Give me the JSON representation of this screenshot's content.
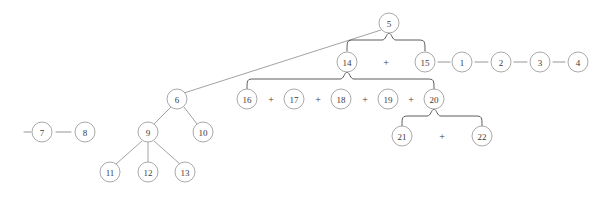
{
  "diagram": {
    "type": "tree",
    "canvas": {
      "width": 615,
      "height": 202
    },
    "colors": {
      "background": "#ffffff",
      "node_stroke": "#9a9a9a",
      "node_fill": "#ffffff",
      "node_text": "#3a3a3a",
      "edge": "#8a8a8a",
      "brace": "#4a4a4a"
    },
    "node_radius": 10,
    "nodes": [
      {
        "id": "n5",
        "label": "5",
        "cx": 389,
        "cy": 23,
        "r": 10
      },
      {
        "id": "n14",
        "label": "14",
        "cx": 347,
        "cy": 62,
        "r": 10
      },
      {
        "id": "n15",
        "label": "15",
        "cx": 425,
        "cy": 62,
        "r": 10
      },
      {
        "id": "n1",
        "label": "1",
        "cx": 462,
        "cy": 62,
        "r": 10
      },
      {
        "id": "n2",
        "label": "2",
        "cx": 501,
        "cy": 62,
        "r": 10
      },
      {
        "id": "n3",
        "label": "3",
        "cx": 540,
        "cy": 62,
        "r": 10
      },
      {
        "id": "n4",
        "label": "4",
        "cx": 578,
        "cy": 62,
        "r": 10
      },
      {
        "id": "n6",
        "label": "6",
        "cx": 177,
        "cy": 99,
        "r": 10
      },
      {
        "id": "n16",
        "label": "16",
        "cx": 247,
        "cy": 99,
        "r": 10
      },
      {
        "id": "n17",
        "label": "17",
        "cx": 294,
        "cy": 99,
        "r": 10
      },
      {
        "id": "n18",
        "label": "18",
        "cx": 341,
        "cy": 99,
        "r": 10
      },
      {
        "id": "n19",
        "label": "19",
        "cx": 388,
        "cy": 99,
        "r": 10
      },
      {
        "id": "n20",
        "label": "20",
        "cx": 434,
        "cy": 99,
        "r": 10
      },
      {
        "id": "n7",
        "label": "7",
        "cx": 42,
        "cy": 132,
        "r": 10
      },
      {
        "id": "n8",
        "label": "8",
        "cx": 85,
        "cy": 132,
        "r": 10
      },
      {
        "id": "n9",
        "label": "9",
        "cx": 148,
        "cy": 132,
        "r": 10
      },
      {
        "id": "n10",
        "label": "10",
        "cx": 203,
        "cy": 132,
        "r": 10
      },
      {
        "id": "n21",
        "label": "21",
        "cx": 402,
        "cy": 136,
        "r": 10
      },
      {
        "id": "n22",
        "label": "22",
        "cx": 482,
        "cy": 136,
        "r": 10
      },
      {
        "id": "n11",
        "label": "11",
        "cx": 110,
        "cy": 172,
        "r": 10
      },
      {
        "id": "n12",
        "label": "12",
        "cx": 148,
        "cy": 172,
        "r": 10
      },
      {
        "id": "n13",
        "label": "13",
        "cx": 185,
        "cy": 172,
        "r": 10
      }
    ],
    "operators": [
      {
        "id": "op-14-15",
        "label": "+",
        "x": 386,
        "y": 62
      },
      {
        "id": "op-16-17",
        "label": "+",
        "x": 271,
        "y": 99
      },
      {
        "id": "op-17-18",
        "label": "+",
        "x": 318,
        "y": 99
      },
      {
        "id": "op-18-19",
        "label": "+",
        "x": 365,
        "y": 99
      },
      {
        "id": "op-19-20",
        "label": "+",
        "x": 411,
        "y": 99
      },
      {
        "id": "op-21-22",
        "label": "+",
        "x": 442,
        "y": 136
      }
    ],
    "dashes": [
      {
        "id": "dash-pre-7",
        "x1": 24,
        "x2": 31,
        "y": 132
      },
      {
        "id": "dash-7-8",
        "x1": 56,
        "x2": 71,
        "y": 132
      },
      {
        "id": "dash-15-1",
        "x1": 438,
        "x2": 450,
        "y": 62
      },
      {
        "id": "dash-1-2",
        "x1": 475,
        "x2": 488,
        "y": 62
      },
      {
        "id": "dash-2-3",
        "x1": 514,
        "x2": 527,
        "y": 62
      },
      {
        "id": "dash-3-4",
        "x1": 553,
        "x2": 565,
        "y": 62
      }
    ],
    "edges": [
      {
        "id": "edge-5-6",
        "from": "n5",
        "to": "n6",
        "x1": 381,
        "y1": 30,
        "x2": 184,
        "y2": 93
      },
      {
        "id": "edge-6-9",
        "from": "n6",
        "to": "n9",
        "x1": 171,
        "y1": 107,
        "x2": 154,
        "y2": 124
      },
      {
        "id": "edge-6-10",
        "from": "n6",
        "to": "n10",
        "x1": 184,
        "y1": 107,
        "x2": 197,
        "y2": 124
      },
      {
        "id": "edge-9-11",
        "from": "n9",
        "to": "n11",
        "x1": 142,
        "y1": 141,
        "x2": 116,
        "y2": 164
      },
      {
        "id": "edge-9-12",
        "from": "n9",
        "to": "n12",
        "x1": 148,
        "y1": 142,
        "x2": 148,
        "y2": 162
      },
      {
        "id": "edge-9-13",
        "from": "n9",
        "to": "n13",
        "x1": 154,
        "y1": 141,
        "x2": 180,
        "y2": 164
      }
    ],
    "braces": [
      {
        "id": "brace-5",
        "parent": "n5",
        "children": [
          "n14",
          "n15"
        ],
        "apex_x": 389,
        "apex_y": 33,
        "bar_y": 40,
        "left_x": 347,
        "right_x": 425,
        "drop_y": 51
      },
      {
        "id": "brace-14",
        "parent": "n14",
        "children": [
          "n16",
          "n17",
          "n18",
          "n19",
          "n20"
        ],
        "apex_x": 347,
        "apex_y": 72,
        "bar_y": 79,
        "left_x": 247,
        "right_x": 434,
        "drop_y": 89
      },
      {
        "id": "brace-20",
        "parent": "n20",
        "children": [
          "n21",
          "n22"
        ],
        "apex_x": 434,
        "apex_y": 109,
        "bar_y": 116,
        "left_x": 402,
        "right_x": 482,
        "drop_y": 126
      }
    ]
  }
}
